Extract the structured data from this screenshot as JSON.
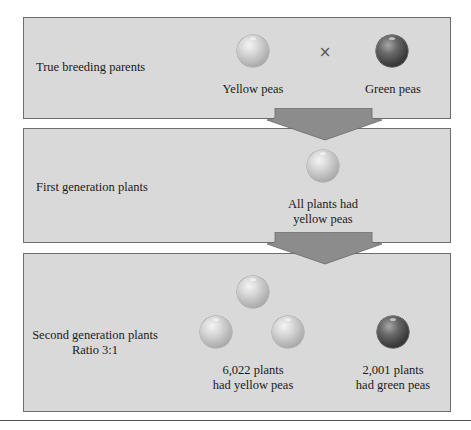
{
  "diagram": {
    "colors": {
      "panel_bg": "#d9d9d9",
      "panel_border": "#6e6e6e",
      "arrow_fill": "#8c8c8c",
      "yellow_pea": "#c4c4c4",
      "green_pea": "#3e3e3e"
    },
    "panels": [
      {
        "label": "True breeding parents",
        "cross_symbol": "×",
        "items": [
          {
            "pea": "yellow",
            "caption": "Yellow peas"
          },
          {
            "pea": "green",
            "caption": "Green peas"
          }
        ]
      },
      {
        "label": "First generation plants",
        "items": [
          {
            "pea": "yellow",
            "caption_line1": "All plants had",
            "caption_line2": "yellow peas"
          }
        ]
      },
      {
        "label_line1": "Second generation plants",
        "label_line2": "Ratio 3:1",
        "items": [
          {
            "pea": "yellow",
            "count": 3,
            "caption_line1": "6,022 plants",
            "caption_line2": "had yellow peas"
          },
          {
            "pea": "green",
            "count": 1,
            "caption_line1": "2,001 plants",
            "caption_line2": "had green peas"
          }
        ]
      }
    ],
    "arrows": [
      {
        "from": "True breeding parents",
        "to": "First generation plants"
      },
      {
        "from": "First generation plants",
        "to": "Second generation plants"
      }
    ]
  }
}
